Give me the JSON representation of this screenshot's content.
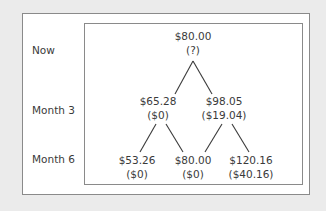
{
  "diagram": {
    "type": "binomial-tree",
    "rows": [
      {
        "label": "Now"
      },
      {
        "label": "Month 3"
      },
      {
        "label": "Month 6"
      }
    ],
    "nodes": {
      "root": {
        "price": "$80.00",
        "value": "(?)"
      },
      "m3_down": {
        "price": "$65.28",
        "value": "($0)"
      },
      "m3_up": {
        "price": "$98.05",
        "value": "($19.04)"
      },
      "m6_down_down": {
        "price": "$53.26",
        "value": "($0)"
      },
      "m6_mid": {
        "price": "$80.00",
        "value": "($0)"
      },
      "m6_up_up": {
        "price": "$120.16",
        "value": "($40.16)"
      }
    },
    "edges": [
      [
        "root",
        "m3_down"
      ],
      [
        "root",
        "m3_up"
      ],
      [
        "m3_down",
        "m6_down_down"
      ],
      [
        "m3_down",
        "m6_mid"
      ],
      [
        "m3_up",
        "m6_mid"
      ],
      [
        "m3_up",
        "m6_up_up"
      ]
    ],
    "colors": {
      "text": "#3a3a3a",
      "border": "#8a8a8a",
      "background": "#ffffff",
      "page_background": "#ebebeb"
    }
  }
}
